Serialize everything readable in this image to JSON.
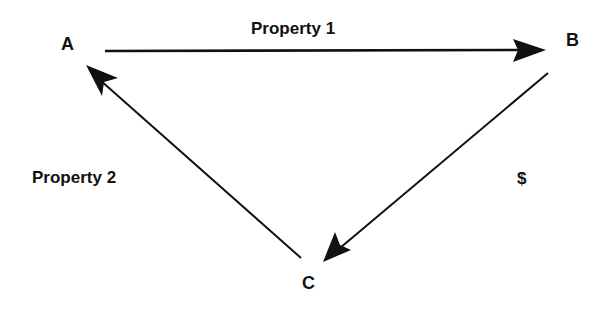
{
  "diagram": {
    "nodes": [
      {
        "id": "A",
        "label": "A"
      },
      {
        "id": "B",
        "label": "B"
      },
      {
        "id": "C",
        "label": "C"
      }
    ],
    "edges": [
      {
        "from": "A",
        "to": "B",
        "label": "Property 1"
      },
      {
        "from": "B",
        "to": "C",
        "label": "$"
      },
      {
        "from": "C",
        "to": "A",
        "label": "Property 2"
      }
    ],
    "colors": {
      "stroke": "#111111",
      "background": "#ffffff"
    }
  }
}
